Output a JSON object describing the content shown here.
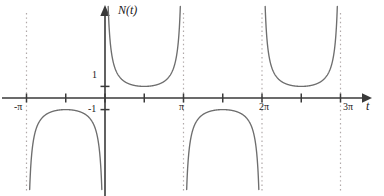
{
  "figure": {
    "title": "",
    "background_color": "#ffffff",
    "axis_color": "#3a3a3a",
    "curve_color": "#6e6e6e",
    "asymptote_color": "#b0a8a8",
    "text_color": "#1a1a1a"
  },
  "axes": {
    "y_axis_label": "N(t)",
    "y_axis_label_parts": {
      "name": "N",
      "open": "(",
      "var": "t",
      "close": ")"
    },
    "x_axis_label": "t",
    "y_tick_labels": [
      {
        "text": "1",
        "value": 1
      },
      {
        "text": "-1",
        "value": -1
      }
    ],
    "x_tick_labels": [
      {
        "text": "-π",
        "value": -3.14159
      },
      {
        "text": "π",
        "value": 3.14159
      },
      {
        "text": "2π",
        "value": 6.28319
      },
      {
        "text": "3π",
        "value": 9.42478
      }
    ],
    "x_ticks_unlabeled": [
      -1.5708,
      0,
      1.5708,
      4.71239,
      7.85398
    ],
    "grid": false,
    "arrow_on_x_positive": true,
    "arrow_on_y_positive": true
  },
  "chart_data": {
    "type": "line",
    "title": "",
    "xlabel": "t",
    "ylabel": "N(t)",
    "function": "sec",
    "xlim": [
      -3.9,
      10.4
    ],
    "ylim": [
      -8.2,
      8.2
    ],
    "grid": false,
    "legend": null,
    "asymptotes": [
      {
        "x": -3.14159,
        "label": "-π"
      },
      {
        "x": 3.14159,
        "label": "π"
      },
      {
        "x": 6.28319,
        "label": "2π"
      },
      {
        "x": 9.42478,
        "label": "3π"
      }
    ],
    "branches": [
      {
        "name": "branch-minus-pi-to-zero",
        "orientation": "down",
        "x_range": [
          -3.14159,
          0
        ],
        "vertex": {
          "x": -1.5708,
          "y": -1
        }
      },
      {
        "name": "branch-zero-to-pi",
        "orientation": "up",
        "x_range": [
          0,
          3.14159
        ],
        "vertex": {
          "x": 1.5708,
          "y": 1
        }
      },
      {
        "name": "branch-pi-to-twopi",
        "orientation": "down",
        "x_range": [
          3.14159,
          6.28319
        ],
        "vertex": {
          "x": 4.71239,
          "y": -1
        }
      },
      {
        "name": "branch-twopi-to-threepi",
        "orientation": "up",
        "x_range": [
          6.28319,
          9.42478
        ],
        "vertex": {
          "x": 7.85398,
          "y": 1
        }
      }
    ]
  }
}
